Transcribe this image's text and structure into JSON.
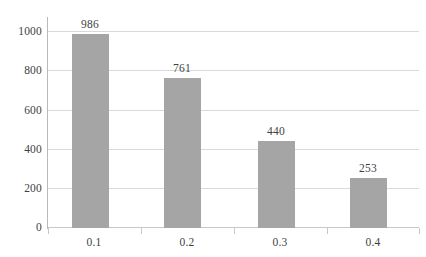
{
  "chart_data": {
    "type": "bar",
    "title": "",
    "subtitle": "",
    "xlabel": "",
    "ylabel": "",
    "categories": [
      "0.1",
      "0.2",
      "0.3",
      "0.4"
    ],
    "values": [
      986,
      761,
      440,
      253
    ],
    "data_labels": [
      "986",
      "761",
      "440",
      "253"
    ],
    "ylim": [
      0,
      1000
    ],
    "yticks": [
      0,
      200,
      400,
      600,
      800,
      1000
    ],
    "ytick_labels": [
      "0",
      "200",
      "400",
      "600",
      "800",
      "1000"
    ],
    "grid": "horizontal",
    "legend": "none",
    "series": [
      {
        "name": "",
        "values": [
          986,
          761,
          440,
          253
        ],
        "color": "#a5a5a5"
      }
    ],
    "colors": {
      "bar": "#a5a5a5",
      "gridline": "#d9d9d9",
      "axis": "#b9b9b9",
      "text": "#3f3f3f",
      "background": "#ffffff"
    }
  }
}
